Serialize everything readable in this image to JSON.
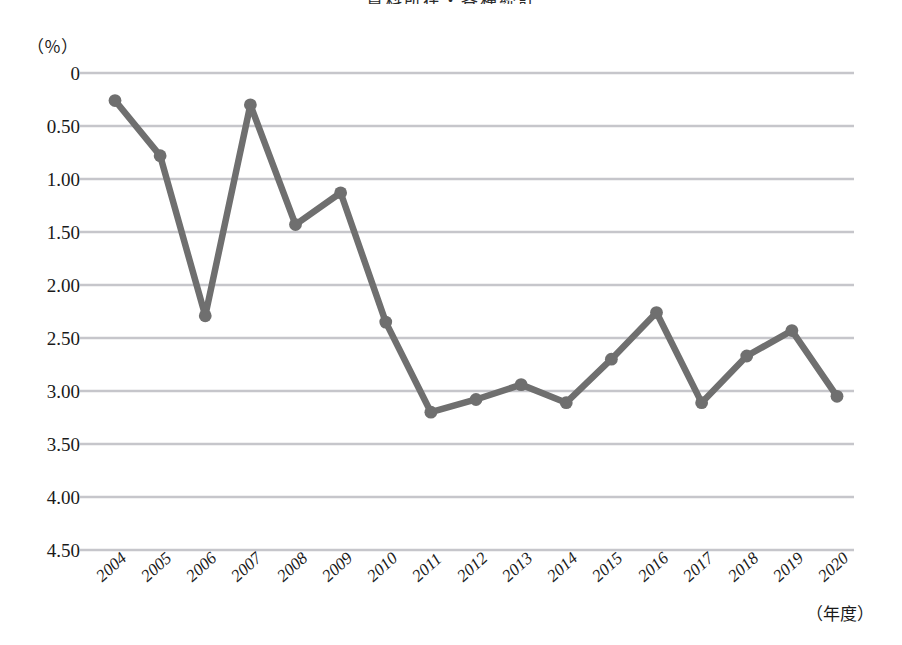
{
  "chart_title": "資料所在・各種統計",
  "axis": {
    "y_unit_label": "（％）",
    "x_unit_label": "（年度）",
    "y_ticks": [
      "4.50",
      "4.00",
      "3.50",
      "3.00",
      "2.50",
      "2.00",
      "1.50",
      "1.00",
      "0.50",
      "0"
    ]
  },
  "chart_data": {
    "type": "line",
    "title": "資料所在・各種統計",
    "xlabel": "（年度）",
    "ylabel": "（％）",
    "ylim": [
      0,
      4.5
    ],
    "y_ticks": [
      0,
      0.5,
      1.0,
      1.5,
      2.0,
      2.5,
      3.0,
      3.5,
      4.0,
      4.5
    ],
    "grid": true,
    "legend": "none",
    "categories": [
      "2004",
      "2005",
      "2006",
      "2007",
      "2008",
      "2009",
      "2010",
      "2011",
      "2012",
      "2013",
      "2014",
      "2015",
      "2016",
      "2017",
      "2018",
      "2019",
      "2020"
    ],
    "values": [
      4.24,
      3.72,
      2.21,
      4.2,
      3.07,
      3.37,
      2.15,
      1.3,
      1.42,
      1.56,
      1.39,
      1.8,
      2.24,
      1.39,
      1.83,
      2.07,
      1.45
    ],
    "line_color": "#6f6f6f",
    "marker": "circle",
    "grid_color": "#c6c6cb"
  }
}
